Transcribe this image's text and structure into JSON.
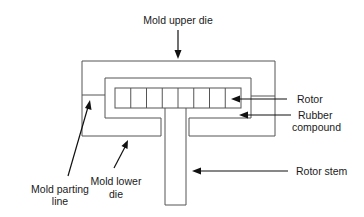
{
  "diagram": {
    "labels": {
      "upper_die": "Mold upper die",
      "rotor": "Rotor",
      "rubber_line1": "Rubber",
      "rubber_line2": "compound",
      "parting_line1": "Mold parting",
      "parting_line2": "line",
      "lower_die_line1": "Mold lower",
      "lower_die_line2": "die",
      "rotor_stem": "Rotor stem"
    },
    "rotor_segments": 8,
    "colors": {
      "line": "#555555",
      "arrow": "#111111",
      "text": "#1a1a1a",
      "background": "#ffffff"
    }
  }
}
